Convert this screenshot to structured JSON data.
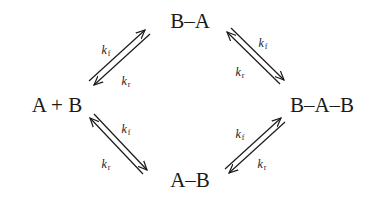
{
  "diagram": {
    "type": "reaction-scheme",
    "nodes": {
      "left": {
        "label": "A + B"
      },
      "top": {
        "label": "B–A"
      },
      "right": {
        "label": "B–A–B"
      },
      "bottom": {
        "label": "A–B"
      }
    },
    "edges": [
      {
        "from": "A + B",
        "to": "B–A",
        "forward": {
          "k": "k",
          "sub": "f"
        },
        "reverse": {
          "k": "k",
          "sub": "r"
        }
      },
      {
        "from": "B–A",
        "to": "B–A–B",
        "forward": {
          "k": "k",
          "sub": "f"
        },
        "reverse": {
          "k": "k",
          "sub": "r"
        }
      },
      {
        "from": "A + B",
        "to": "A–B",
        "forward": {
          "k": "k",
          "sub": "f"
        },
        "reverse": {
          "k": "k",
          "sub": "r"
        }
      },
      {
        "from": "A–B",
        "to": "B–A–B",
        "forward": {
          "k": "k",
          "sub": "f"
        },
        "reverse": {
          "k": "k",
          "sub": "r"
        }
      }
    ],
    "colors": {
      "ink": "#1a1a1a",
      "background": "#ffffff"
    }
  }
}
